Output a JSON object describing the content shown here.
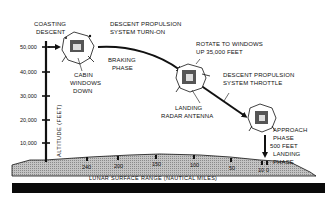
{
  "diagram": {
    "y_axis": {
      "label": "ALTITUDE (FEET)",
      "ticks": [
        "50,000",
        "40,000",
        "30,000",
        "20,000",
        "10,000"
      ]
    },
    "x_axis": {
      "label": "LUNAR SURFACE RANGE (NAUTICAL MILES)",
      "ticks": [
        "240",
        "200",
        "150",
        "100",
        "50",
        "10",
        "0"
      ]
    },
    "annotations": {
      "coasting_descent": [
        "COASTING",
        "DESCENT"
      ],
      "dps_turn_on": [
        "DESCENT PROPULSION",
        "SYSTEM TURN-ON"
      ],
      "cabin_windows_down": [
        "CABIN",
        "WINDOWS",
        "DOWN"
      ],
      "braking_phase": [
        "BRAKING",
        "PHASE"
      ],
      "rotate_windows_up": [
        "ROTATE TO WINDOWS",
        "UP 35,000 FEET"
      ],
      "landing_radar_antenna": [
        "LANDING",
        "RADAR ANTENNA"
      ],
      "dps_throttle": [
        "DESCENT PROPULSION",
        "SYSTEM THROTTLE"
      ],
      "approach_phase": [
        "APPROACH",
        "PHASE"
      ],
      "five_hundred_feet": "500 FEET",
      "landing_phase": [
        "LANDING",
        "PHASE"
      ]
    },
    "colors": {
      "ink": "#111111",
      "surface_fill": "#b8b8b8",
      "background": "#ffffff",
      "bottom_bar": "#0a0a0a"
    }
  }
}
